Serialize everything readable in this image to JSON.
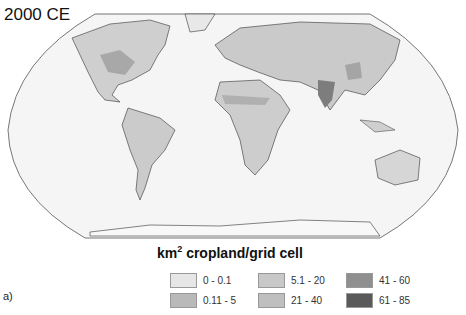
{
  "title": "2000 CE",
  "panel_label": "a)",
  "legend": {
    "title_prefix": "km",
    "title_sup": "2",
    "title_suffix": " cropland/grid cell",
    "items": [
      {
        "label": "0 - 0.1",
        "color": "#e6e6e6"
      },
      {
        "label": "5.1 - 20",
        "color": "#c8c8c8"
      },
      {
        "label": "41 - 60",
        "color": "#8f8f8f"
      },
      {
        "label": "0.11 - 5",
        "color": "#b9b9b9"
      },
      {
        "label": "21 - 40",
        "color": "#bfbfbf"
      },
      {
        "label": "61 - 85",
        "color": "#5a5a5a"
      }
    ]
  },
  "map": {
    "projection": "Robinson",
    "ocean_color": "#f4f4f4",
    "land_color": "#d3d3d3",
    "coast_color": "#333333"
  }
}
